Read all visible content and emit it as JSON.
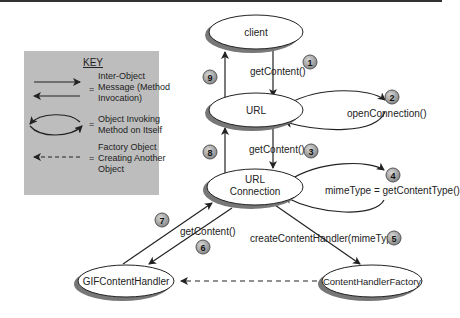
{
  "key": {
    "title": "KEY",
    "entries": [
      {
        "line1": "Inter-Object",
        "line2": "Message (Method",
        "line3": "Invocation)"
      },
      {
        "line1": "Object Invoking",
        "line2": "Method on Itself"
      },
      {
        "line1": "Factory Object",
        "line2": "Creating Another",
        "line3": "Object"
      }
    ],
    "equals": "="
  },
  "nodes": {
    "client": "client",
    "url": "URL",
    "urlconn_line1": "URL",
    "urlconn_line2": "Connection",
    "gif": "GIFContentHandler",
    "factory": "ContentHandlerFactory"
  },
  "edges": {
    "e1": "getContent()",
    "e2": "openConnection()",
    "e3": "getContent()",
    "e4": "mimeType = getContentType()",
    "e5": "createContentHandler(mimeType)",
    "e6": "getContent()"
  },
  "steps": [
    "1",
    "2",
    "3",
    "4",
    "5",
    "6",
    "7",
    "8",
    "9"
  ],
  "colors": {
    "key_bg": "#bdbdbd",
    "badge": "#9a9a9a",
    "line": "#222222"
  }
}
